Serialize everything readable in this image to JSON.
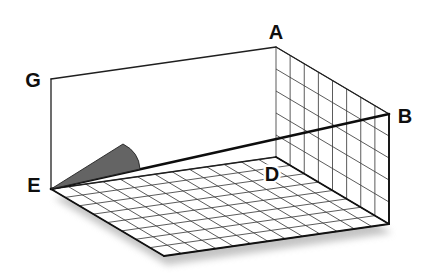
{
  "figure": {
    "type": "oblique-3d-room-diagram",
    "canvas": {
      "width": 425,
      "height": 275,
      "background": "#ffffff"
    },
    "origin_E": [
      51,
      189
    ],
    "long_vector": [
      225,
      -32
    ],
    "depth_vector": [
      113,
      67
    ],
    "up_vector": [
      0,
      -110
    ],
    "floor_grid": {
      "cols": 13,
      "rows": 8
    },
    "wall_grid": {
      "cols": 8,
      "rows": 5
    },
    "diagonal": {
      "from": "E",
      "to": "B",
      "stroke_width": 2.7
    },
    "wedge": {
      "apex": [
        123,
        144
      ],
      "end_on_diagonal": [
        140,
        169
      ],
      "curve_control": [
        139,
        152
      ]
    },
    "shadow": {
      "offset": [
        3,
        9
      ],
      "blur": 3.6,
      "opacity": 0.62
    },
    "widths": {
      "grid": 0.85,
      "medium": 1.3,
      "outer": 1.9
    },
    "colors": {
      "grid_line": "#3d3d3d",
      "medium_edge": "#1f1f1f",
      "outer_edge": "#111111",
      "diagonal": "#0d0d0d",
      "wedge_fill": "#646464",
      "wedge_edge": "#222222",
      "shadow": "#a0a0a0",
      "label": "#0f0f0f",
      "surface": "#ffffff"
    },
    "label_font_size": 20,
    "labels": [
      {
        "id": "A",
        "text": "A",
        "x": 276,
        "y": 32
      },
      {
        "id": "G",
        "text": "G",
        "x": 33,
        "y": 80
      },
      {
        "id": "B",
        "text": "B",
        "x": 405,
        "y": 116
      },
      {
        "id": "E",
        "text": "E",
        "x": 34,
        "y": 185
      },
      {
        "id": "D",
        "text": "D",
        "x": 272,
        "y": 174
      }
    ]
  }
}
